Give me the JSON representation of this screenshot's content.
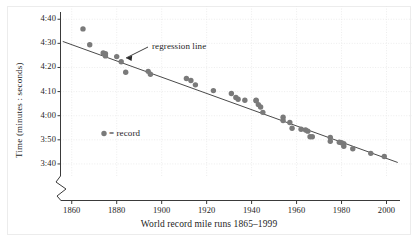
{
  "chart_data": {
    "type": "scatter",
    "title": "",
    "xlabel": "World record mile runs 1865–1999",
    "ylabel": "Time (minutes : seconds)",
    "xlim": [
      1855,
      2006
    ],
    "ylim": [
      215,
      283
    ],
    "grid": true,
    "axis_break_y": true,
    "y_ticks": [
      {
        "value": 220,
        "label": "3:40"
      },
      {
        "value": 230,
        "label": "3:50"
      },
      {
        "value": 240,
        "label": "4:00"
      },
      {
        "value": 250,
        "label": "4:10"
      },
      {
        "value": 260,
        "label": "4:20"
      },
      {
        "value": 270,
        "label": "4:30"
      },
      {
        "value": 280,
        "label": "4:40"
      }
    ],
    "x_ticks": [
      {
        "value": 1860,
        "label": "1860"
      },
      {
        "value": 1880,
        "label": "1880"
      },
      {
        "value": 1900,
        "label": "1900"
      },
      {
        "value": 1920,
        "label": "1920"
      },
      {
        "value": 1940,
        "label": "1940"
      },
      {
        "value": 1960,
        "label": "1960"
      },
      {
        "value": 1980,
        "label": "1980"
      },
      {
        "value": 2000,
        "label": "2000"
      }
    ],
    "series": [
      {
        "name": "record",
        "marker": "circle",
        "color": "#7a7a7a",
        "x": [
          1865,
          1868,
          1874,
          1875,
          1875,
          1880,
          1882,
          1884,
          1894,
          1895,
          1911,
          1913,
          1915,
          1923,
          1931,
          1933,
          1934,
          1937,
          1942,
          1942,
          1943,
          1944,
          1945,
          1954,
          1954,
          1957,
          1958,
          1962,
          1964,
          1965,
          1966,
          1967,
          1975,
          1975,
          1979,
          1980,
          1981,
          1981,
          1985,
          1993,
          1999
        ],
        "y": [
          276.0,
          269.4,
          266.0,
          265.7,
          264.8,
          264.5,
          262.4,
          258.0,
          258.4,
          257.2,
          255.4,
          254.6,
          252.8,
          250.4,
          249.2,
          247.6,
          246.8,
          246.4,
          246.2,
          246.4,
          244.6,
          243.6,
          241.4,
          239.4,
          238.0,
          237.2,
          234.8,
          234.4,
          234.1,
          233.6,
          231.3,
          231.3,
          231.0,
          229.4,
          229.0,
          228.8,
          228.4,
          227.3,
          226.3,
          224.4,
          223.1
        ]
      }
    ],
    "regression_line": {
      "label": "regression line",
      "x_start": 1856,
      "y_start": 270.8,
      "x_end": 2005,
      "y_end": 220.6,
      "color": "#4a4a4a"
    },
    "legend": {
      "position": "inside-left",
      "entries": [
        {
          "marker": "circle",
          "color": "#7a7a7a",
          "label": "= record"
        }
      ]
    },
    "annotations": [
      {
        "text": "regression line",
        "x": 1898,
        "y": 272.0
      }
    ]
  },
  "axes": {
    "y_title": "Time (minutes : seconds)",
    "x_title": "World record mile runs 1865–1999"
  },
  "colors": {
    "marker": "#7a7a7a",
    "line": "#4a4a4a",
    "axis": "#3a3a3a",
    "grid": "#e8e8e8",
    "frame": "#ececec",
    "text": "#1d1d1d",
    "background": "#ffffff"
  },
  "legend_label": "= record",
  "annotation_label": "regression line"
}
